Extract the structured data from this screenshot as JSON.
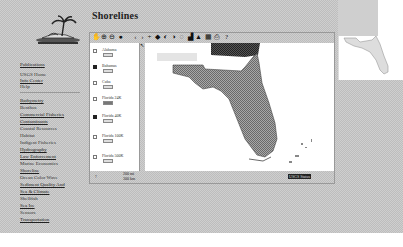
{
  "sidebar": {
    "logo_alt": "Palm tree island logo",
    "top_links": [
      {
        "label": "Publications",
        "top": 62
      },
      {
        "label": "USGS Home",
        "top": 72
      },
      {
        "label": "Info Center",
        "top": 78
      },
      {
        "label": "Help",
        "top": 84
      }
    ],
    "items": [
      "Bathymetry",
      "Benthos",
      "Commercial Fisheries",
      "Contaminants",
      "Coastal Resources",
      "Habitat",
      "Indigent Fisheries",
      "Hydrography",
      "Law Enforcement",
      "Marine Economics",
      "Shoreline",
      "Ocean Color Wave",
      "Sediment Quality And",
      "Sea & Climate",
      "Shellfish",
      "Sea Ice",
      "Sensors",
      "Transportation"
    ]
  },
  "header": {
    "title": "Shorelines"
  },
  "viewer": {
    "toolbar": {
      "icons": [
        {
          "name": "pan-icon",
          "glyph": "✋"
        },
        {
          "name": "zoom-in-icon",
          "glyph": "⊕"
        },
        {
          "name": "zoom-out-icon",
          "glyph": "⊖"
        },
        {
          "name": "globe-icon",
          "glyph": "●"
        },
        {
          "name": "back-icon",
          "glyph": "‹"
        },
        {
          "name": "forward-icon",
          "glyph": "›"
        },
        {
          "name": "pointer-icon",
          "glyph": "+"
        },
        {
          "name": "identify-icon",
          "glyph": "◆"
        },
        {
          "name": "refresh-icon",
          "glyph": "◐"
        },
        {
          "name": "select-icon",
          "glyph": "◑"
        },
        {
          "name": "clear-icon",
          "glyph": "◌"
        },
        {
          "name": "measure-icon",
          "glyph": "▟"
        },
        {
          "name": "buffer-icon",
          "glyph": "▲"
        },
        {
          "name": "query-icon",
          "glyph": "▦"
        },
        {
          "name": "print-icon",
          "glyph": "⎙"
        },
        {
          "name": "help-icon",
          "glyph": "?"
        }
      ]
    },
    "legend": {
      "layers": [
        {
          "label": "Alabama",
          "checked": false,
          "dark": false
        },
        {
          "label": "Bahamas",
          "checked": true,
          "dark": false
        },
        {
          "label": "Cuba",
          "checked": false,
          "dark": false
        },
        {
          "label": "Florida 24K",
          "checked": false,
          "dark": true
        },
        {
          "label": "Florida 40K",
          "checked": true,
          "dark": false
        },
        {
          "label": "Florida 100K",
          "checked": false,
          "dark": false
        },
        {
          "label": "Florida 500K",
          "checked": false,
          "dark": false
        }
      ]
    },
    "statusbar": {
      "left_text": "?",
      "scale_text": "200 mi",
      "scale_sub": "300 km",
      "right_text": "USGS Status"
    }
  },
  "colors": {
    "background_dither": "#cfcfcf",
    "land_fill": "#8a8a8a",
    "state_border_region": "#444444"
  }
}
